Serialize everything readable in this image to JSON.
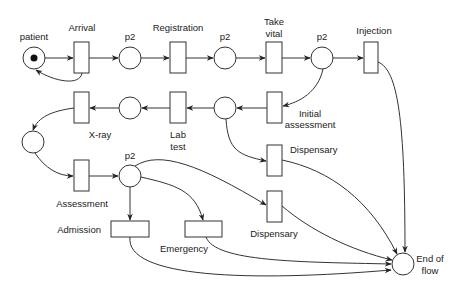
{
  "diagram": {
    "type": "petri-net",
    "colors": {
      "stroke": "#333333",
      "fill": "#ffffff",
      "token": "#111111",
      "text": "#222222"
    },
    "places": [
      {
        "id": "patient",
        "label": "patient",
        "tokens": 1
      },
      {
        "id": "p2a",
        "label": "p2",
        "tokens": 0
      },
      {
        "id": "p2b",
        "label": "p2",
        "tokens": 0
      },
      {
        "id": "p2c",
        "label": "p2",
        "tokens": 0
      },
      {
        "id": "p_lab_in",
        "label": "",
        "tokens": 0
      },
      {
        "id": "p_xray_in",
        "label": "",
        "tokens": 0
      },
      {
        "id": "p_assess_in",
        "label": "",
        "tokens": 0
      },
      {
        "id": "p2d",
        "label": "p2",
        "tokens": 0
      },
      {
        "id": "end",
        "label_line1": "End of",
        "label_line2": "flow",
        "tokens": 0
      }
    ],
    "transitions": [
      {
        "id": "arrival",
        "label": "Arrival"
      },
      {
        "id": "registration",
        "label": "Registration"
      },
      {
        "id": "take_vital",
        "label_line1": "Take",
        "label_line2": "vital"
      },
      {
        "id": "injection",
        "label": "Injection"
      },
      {
        "id": "initial_assessment",
        "label_line1": "Initial",
        "label_line2": "assessment"
      },
      {
        "id": "lab_test",
        "label_line1": "Lab",
        "label_line2": "test"
      },
      {
        "id": "xray",
        "label": "X-ray"
      },
      {
        "id": "dispensary1",
        "label": "Dispensary"
      },
      {
        "id": "assessment",
        "label": "Assessment"
      },
      {
        "id": "dispensary2",
        "label": "Dispensary"
      },
      {
        "id": "admission",
        "label": "Admission"
      },
      {
        "id": "emergency",
        "label": "Emergency"
      }
    ],
    "arcs": [
      [
        "patient",
        "arrival"
      ],
      [
        "arrival",
        "patient"
      ],
      [
        "arrival",
        "p2a"
      ],
      [
        "p2a",
        "registration"
      ],
      [
        "registration",
        "p2b"
      ],
      [
        "p2b",
        "take_vital"
      ],
      [
        "take_vital",
        "p2c"
      ],
      [
        "p2c",
        "injection"
      ],
      [
        "p2c",
        "initial_assessment"
      ],
      [
        "injection",
        "end"
      ],
      [
        "initial_assessment",
        "p_lab_in"
      ],
      [
        "p_lab_in",
        "lab_test"
      ],
      [
        "p_lab_in",
        "dispensary1"
      ],
      [
        "lab_test",
        "p_xray_in"
      ],
      [
        "p_xray_in",
        "xray"
      ],
      [
        "xray",
        "p_assess_in"
      ],
      [
        "p_assess_in",
        "assessment"
      ],
      [
        "assessment",
        "p2d"
      ],
      [
        "p2d",
        "dispensary2"
      ],
      [
        "p2d",
        "emergency"
      ],
      [
        "p2d",
        "admission"
      ],
      [
        "dispensary1",
        "end"
      ],
      [
        "dispensary2",
        "end"
      ],
      [
        "emergency",
        "end"
      ],
      [
        "admission",
        "end"
      ]
    ]
  }
}
